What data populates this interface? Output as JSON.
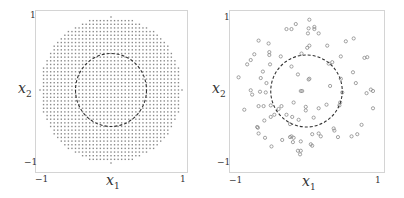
{
  "chart_data": [
    {
      "type": "scatter",
      "title": "",
      "xlabel": "x1",
      "ylabel": "x2",
      "xlim": [
        -1,
        1
      ],
      "ylim": [
        -1,
        1
      ],
      "xticks": [
        "-1",
        "1"
      ],
      "yticks": [
        "-1",
        "1"
      ],
      "grid": false,
      "legend": null,
      "description": "Dense regular grid of points filling the unit disk (spacing ~0.05), with a dashed circle of radius 0.5 centered at origin",
      "series": [
        {
          "name": "grid-points",
          "marker": "small-dot",
          "color": "#8a8a8a",
          "region": "disk",
          "center": [
            0,
            0
          ],
          "radius": 1.0,
          "spacing": 0.05
        },
        {
          "name": "decision-circle",
          "kind": "circle",
          "style": "dashed",
          "color": "#333333",
          "center": [
            0,
            0
          ],
          "radius": 0.5
        }
      ]
    },
    {
      "type": "scatter",
      "title": "",
      "xlabel": "x1",
      "ylabel": "x2",
      "xlim": [
        -1,
        1
      ],
      "ylim": [
        -1,
        1
      ],
      "xticks": [
        "-1",
        "1"
      ],
      "yticks": [
        "-1",
        "1"
      ],
      "grid": false,
      "legend": null,
      "description": "Randomly sampled points (open circles) within the unit disk, with a dashed circle of radius 0.5 centered at origin",
      "series": [
        {
          "name": "samples",
          "marker": "open-circle",
          "color": "#8a8a8a",
          "points": [
            [
              0.04,
              0.99
            ],
            [
              -0.15,
              0.93
            ],
            [
              -0.28,
              0.86
            ],
            [
              -0.21,
              0.86
            ],
            [
              0.03,
              0.87
            ],
            [
              0.11,
              0.89
            ],
            [
              0.11,
              0.86
            ],
            [
              0.02,
              0.8
            ],
            [
              0.17,
              0.8
            ],
            [
              -0.67,
              0.7
            ],
            [
              -0.53,
              0.66
            ],
            [
              0.55,
              0.69
            ],
            [
              0.66,
              0.73
            ],
            [
              0.29,
              0.63
            ],
            [
              0.04,
              0.63
            ],
            [
              0.01,
              0.6
            ],
            [
              -0.73,
              0.51
            ],
            [
              -0.52,
              0.54
            ],
            [
              -0.52,
              0.5
            ],
            [
              -0.07,
              0.52
            ],
            [
              -0.36,
              0.48
            ],
            [
              0.48,
              0.48
            ],
            [
              0.81,
              0.46
            ],
            [
              0.85,
              0.47
            ],
            [
              -0.78,
              0.43
            ],
            [
              -0.83,
              0.37
            ],
            [
              -0.51,
              0.37
            ],
            [
              0.36,
              0.4
            ],
            [
              0.31,
              0.38
            ],
            [
              -0.21,
              0.34
            ],
            [
              -0.61,
              0.27
            ],
            [
              0.65,
              0.26
            ],
            [
              -0.95,
              0.19
            ],
            [
              -0.64,
              0.18
            ],
            [
              -0.12,
              0.23
            ],
            [
              0.03,
              0.16
            ],
            [
              0.04,
              0.17
            ],
            [
              0.48,
              0.17
            ],
            [
              -0.56,
              0.11
            ],
            [
              0.69,
              0.11
            ],
            [
              0.33,
              0.07
            ],
            [
              -0.78,
              0.01
            ],
            [
              -0.76,
              -0.05
            ],
            [
              -0.65,
              -0.01
            ],
            [
              -0.57,
              -0.02
            ],
            [
              -0.08,
              0.0
            ],
            [
              -0.06,
              0.0
            ],
            [
              0.9,
              0.02
            ],
            [
              0.93,
              -0.0
            ],
            [
              0.5,
              -0.02
            ],
            [
              0.84,
              -0.03
            ],
            [
              -0.87,
              -0.26
            ],
            [
              -0.67,
              -0.21
            ],
            [
              -0.6,
              -0.21
            ],
            [
              -0.5,
              -0.2
            ],
            [
              -0.35,
              -0.21
            ],
            [
              -0.18,
              -0.16
            ],
            [
              -0.01,
              -0.22
            ],
            [
              -0.01,
              -0.27
            ],
            [
              0.17,
              -0.24
            ],
            [
              0.28,
              -0.19
            ],
            [
              0.46,
              -0.2
            ],
            [
              0.47,
              -0.16
            ],
            [
              0.93,
              -0.24
            ],
            [
              -0.39,
              -0.25
            ],
            [
              -0.45,
              -0.33
            ],
            [
              -0.5,
              -0.36
            ],
            [
              -0.28,
              -0.33
            ],
            [
              -0.2,
              -0.36
            ],
            [
              0.1,
              -0.37
            ],
            [
              -0.59,
              -0.41
            ],
            [
              -0.69,
              -0.5
            ],
            [
              -0.68,
              -0.51
            ],
            [
              -0.23,
              -0.46
            ],
            [
              -0.11,
              -0.4
            ],
            [
              0.38,
              -0.52
            ],
            [
              0.39,
              -0.55
            ],
            [
              0.77,
              -0.47
            ],
            [
              -0.67,
              -0.59
            ],
            [
              -0.58,
              -0.65
            ],
            [
              -0.34,
              -0.68
            ],
            [
              -0.23,
              -0.64
            ],
            [
              -0.21,
              -0.63
            ],
            [
              -0.18,
              -0.65
            ],
            [
              -0.19,
              -0.71
            ],
            [
              0.08,
              -0.6
            ],
            [
              0.17,
              -0.59
            ],
            [
              0.2,
              -0.63
            ],
            [
              0.44,
              -0.64
            ],
            [
              0.63,
              -0.63
            ],
            [
              0.71,
              -0.6
            ],
            [
              -0.49,
              -0.77
            ],
            [
              -0.08,
              -0.7
            ],
            [
              0.06,
              -0.74
            ],
            [
              0.08,
              -0.76
            ],
            [
              -0.12,
              -0.83
            ],
            [
              -0.08,
              -0.83
            ],
            [
              -0.09,
              -0.88
            ]
          ]
        },
        {
          "name": "decision-circle",
          "kind": "circle",
          "style": "dashed",
          "color": "#333333",
          "center": [
            0,
            0
          ],
          "radius": 0.5
        }
      ]
    }
  ],
  "panels": [
    {
      "xlabel_main": "x",
      "xlabel_sub": "1",
      "ylabel_main": "x",
      "ylabel_sub": "2",
      "xtick_min": "−1",
      "xtick_max": "1",
      "ytick_min": "−1",
      "ytick_max": "1"
    },
    {
      "xlabel_main": "x",
      "xlabel_sub": "1",
      "ylabel_main": "x",
      "ylabel_sub": "2",
      "xtick_min": "−1",
      "xtick_max": "1",
      "ytick_min": "−1",
      "ytick_max": "1"
    }
  ],
  "colors": {
    "points": "#8a8a8a",
    "circle": "#333333",
    "frame": "#d4d4d4"
  }
}
